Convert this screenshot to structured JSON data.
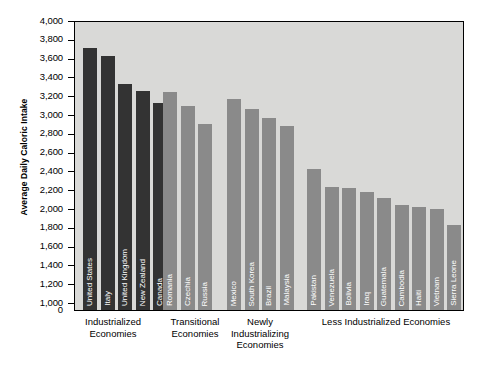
{
  "chart_data": {
    "type": "bar",
    "title": "",
    "xlabel": "",
    "ylabel": "Average Daily Caloric Intake",
    "ylim": [
      1000,
      4000
    ],
    "axis_break_below": 1000,
    "grid": false,
    "legend": "none",
    "y_ticks": [
      "4,000",
      "3,800",
      "3,600",
      "3,400",
      "3,200",
      "3,000",
      "2,800",
      "2,600",
      "2,400",
      "2,200",
      "2,000",
      "1,800",
      "1,600",
      "1,400",
      "1,200",
      "1,000",
      "0"
    ],
    "groups": [
      {
        "label": "Industrialized\nEconomies",
        "color": "#333333",
        "categories": [
          "United States",
          "Italy",
          "United Kingdom",
          "New Zealand",
          "Canada"
        ],
        "values": [
          3720,
          3640,
          3340,
          3270,
          3140
        ]
      },
      {
        "label": "Transitional\nEconomies",
        "color": "#8a8a8a",
        "categories": [
          "Romania",
          "Czechia",
          "Russia"
        ],
        "values": [
          3260,
          3110,
          2910
        ]
      },
      {
        "label": "Newly\nIndustrializing\nEconomies",
        "color": "#8a8a8a",
        "categories": [
          "Mexico",
          "South Korea",
          "Brazil",
          "Malaysia"
        ],
        "values": [
          3180,
          3070,
          2980,
          2890
        ]
      },
      {
        "label": "Less Industrialized Economies",
        "color": "#8a8a8a",
        "categories": [
          "Pakistan",
          "Venezuela",
          "Bolivia",
          "Iraq",
          "Guatemala",
          "Cambodia",
          "Haiti",
          "Vietnam",
          "Sierra Leone",
          "Afghanistan"
        ],
        "values": [
          2440,
          2250,
          2230,
          2190,
          2130,
          2050,
          2030,
          2010,
          1840,
          1840
        ]
      }
    ]
  },
  "plot": {
    "background_color": "#d9d9d7",
    "border_color": "#000000"
  }
}
